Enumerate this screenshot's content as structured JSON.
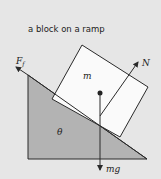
{
  "diagram": {
    "title": "a block on a ramp",
    "labels": {
      "friction": "F",
      "friction_sub": "f",
      "normal": "N",
      "mass": "m",
      "angle": "θ",
      "weight": "mg"
    },
    "colors": {
      "background": "#e6e6e6",
      "ramp_fill": "#b3b3b3",
      "block_fill": "#fafafa",
      "stroke": "#2a2a2a"
    }
  }
}
